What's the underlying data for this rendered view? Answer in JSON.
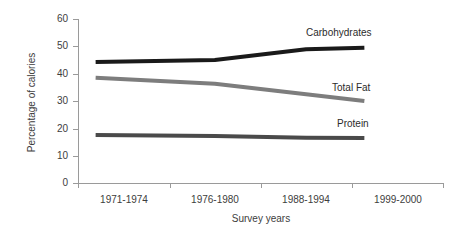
{
  "chart_data": {
    "type": "line",
    "title": "",
    "xlabel": "Survey years",
    "ylabel": "Percentage of calories",
    "categories": [
      "1971-1974",
      "1976-1980",
      "1988-1994",
      "1999-2000"
    ],
    "ylim": [
      0,
      60
    ],
    "yticks": [
      0,
      10,
      20,
      30,
      40,
      50,
      60
    ],
    "grid": false,
    "legend_position": "inline-right-of-series",
    "series": [
      {
        "name": "Carbohydrates",
        "values": [
          44.3,
          45.0,
          48.9,
          49.5
        ],
        "color": "#1a1a1a"
      },
      {
        "name": "Total Fat",
        "values": [
          38.5,
          36.3,
          32.5,
          30.0
        ],
        "color": "#7d7d7d"
      },
      {
        "name": "Protein",
        "values": [
          17.6,
          17.2,
          16.6,
          16.5
        ],
        "color": "#4a4a4a"
      }
    ]
  },
  "axes": {
    "y_title": "Percentage of calories",
    "x_title": "Survey years",
    "y_tick_labels": [
      "60",
      "50",
      "40",
      "30",
      "20",
      "10",
      "0"
    ],
    "x_tick_labels": [
      "1971-1974",
      "1976-1980",
      "1988-1994",
      "1999-2000"
    ]
  },
  "series_labels": {
    "carbohydrates": "Carbohydrates",
    "total_fat": "Total Fat",
    "protein": "Protein"
  },
  "colors": {
    "axis": "#9a9a9a",
    "text": "#3d3d3d",
    "carbohydrates": "#1a1a1a",
    "total_fat": "#7d7d7d",
    "protein": "#4a4a4a",
    "background": "#ffffff"
  }
}
